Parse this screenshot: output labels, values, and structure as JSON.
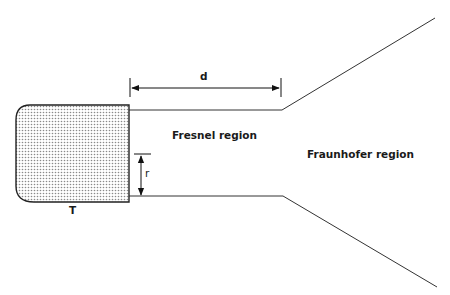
{
  "diagram": {
    "labels": {
      "distance": "d",
      "radius": "r",
      "transducer": "T",
      "near_field": "Fresnel region",
      "far_field": "Fraunhofer region"
    },
    "colors": {
      "line": "#333333",
      "fill_dots": "#999999"
    }
  }
}
